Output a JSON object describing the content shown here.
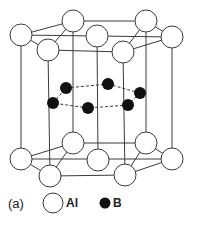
{
  "figure": {
    "caption": "(a)",
    "colors": {
      "line": "#3a3a3a",
      "al_fill": "#ffffff",
      "b_fill": "#111111"
    }
  },
  "legend": {
    "items": [
      {
        "symbol": "open-circle",
        "label": "Al"
      },
      {
        "symbol": "filled-circle",
        "label": "B"
      }
    ]
  },
  "atoms": {
    "al_radius": 11,
    "b_radius": 6,
    "al_top": [
      {
        "id": "t-left",
        "x": 21,
        "y": 35
      },
      {
        "id": "t-back-left",
        "x": 73,
        "y": 21
      },
      {
        "id": "t-back-right",
        "x": 146,
        "y": 21
      },
      {
        "id": "t-right",
        "x": 172,
        "y": 37
      },
      {
        "id": "t-front-right",
        "x": 123,
        "y": 52
      },
      {
        "id": "t-front-left",
        "x": 48,
        "y": 50
      },
      {
        "id": "t-center",
        "x": 97,
        "y": 36
      }
    ],
    "al_bottom": [
      {
        "id": "b-left",
        "x": 21,
        "y": 159
      },
      {
        "id": "b-back-left",
        "x": 73,
        "y": 143
      },
      {
        "id": "b-back-right",
        "x": 146,
        "y": 143
      },
      {
        "id": "b-right",
        "x": 172,
        "y": 159
      },
      {
        "id": "b-front-right",
        "x": 125,
        "y": 175
      },
      {
        "id": "b-front-left",
        "x": 50,
        "y": 176
      },
      {
        "id": "b-center",
        "x": 98,
        "y": 160
      }
    ],
    "b_middle": [
      {
        "x": 66,
        "y": 88
      },
      {
        "x": 108,
        "y": 84
      },
      {
        "x": 140,
        "y": 93
      },
      {
        "x": 128,
        "y": 105
      },
      {
        "x": 88,
        "y": 108
      },
      {
        "x": 53,
        "y": 103
      }
    ]
  }
}
